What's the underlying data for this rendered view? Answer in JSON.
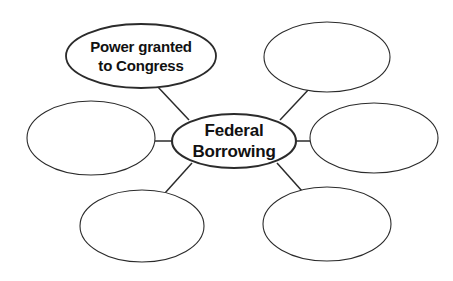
{
  "diagram": {
    "type": "concept-web",
    "background_color": "#ffffff",
    "stroke_color": "#2b2b2b",
    "text_color": "#111111",
    "center": {
      "id": "center",
      "label_line1": "Federal",
      "label_line2": "Borrowing",
      "cx": 234,
      "cy": 141,
      "rx": 62,
      "ry": 27,
      "stroke_width": 2.1,
      "font_size": 17,
      "filled": true
    },
    "nodes": [
      {
        "id": "top-left",
        "label_line1": "Power granted",
        "label_line2": "to Congress",
        "cx": 141,
        "cy": 56,
        "rx": 75,
        "ry": 32,
        "stroke_width": 1.8,
        "font_size": 15,
        "filled": true
      },
      {
        "id": "top-right",
        "label_line1": "",
        "label_line2": "",
        "cx": 327,
        "cy": 57,
        "rx": 63,
        "ry": 35,
        "stroke_width": 1.1,
        "font_size": 15,
        "filled": false
      },
      {
        "id": "left",
        "label_line1": "",
        "label_line2": "",
        "cx": 91,
        "cy": 138,
        "rx": 64,
        "ry": 37,
        "stroke_width": 1.1,
        "font_size": 15,
        "filled": false
      },
      {
        "id": "right",
        "label_line1": "",
        "label_line2": "",
        "cx": 374,
        "cy": 138,
        "rx": 64,
        "ry": 35,
        "stroke_width": 1.1,
        "font_size": 15,
        "filled": false
      },
      {
        "id": "bottom-left",
        "label_line1": "",
        "label_line2": "",
        "cx": 142,
        "cy": 226,
        "rx": 62,
        "ry": 36,
        "stroke_width": 1.1,
        "font_size": 15,
        "filled": false
      },
      {
        "id": "bottom-right",
        "label_line1": "",
        "label_line2": "",
        "cx": 327,
        "cy": 224,
        "rx": 64,
        "ry": 37,
        "stroke_width": 1.1,
        "font_size": 15,
        "filled": false
      }
    ],
    "connectors": [
      {
        "id": "center-to-top-left",
        "x1": 189,
        "y1": 120,
        "x2": 157,
        "y2": 86,
        "stroke_width": 1.5
      },
      {
        "id": "center-to-top-right",
        "x1": 280,
        "y1": 120,
        "x2": 310,
        "y2": 88,
        "stroke_width": 1.5
      },
      {
        "id": "center-to-left",
        "x1": 155,
        "y1": 141,
        "x2": 172,
        "y2": 141,
        "stroke_width": 1.5
      },
      {
        "id": "center-to-right",
        "x1": 296,
        "y1": 141,
        "x2": 312,
        "y2": 141,
        "stroke_width": 1.5
      },
      {
        "id": "center-to-bottom-left",
        "x1": 192,
        "y1": 163,
        "x2": 165,
        "y2": 193,
        "stroke_width": 1.5
      },
      {
        "id": "center-to-bottom-right",
        "x1": 277,
        "y1": 163,
        "x2": 302,
        "y2": 191,
        "stroke_width": 1.5
      }
    ]
  }
}
